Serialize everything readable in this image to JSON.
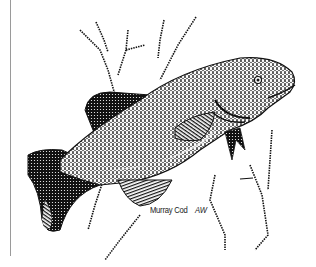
{
  "illustration": {
    "subject": "Murray Cod",
    "style": "pen-and-ink stipple drawing",
    "caption": {
      "species": "Murray Cod",
      "initials": "AW"
    }
  },
  "colors": {
    "ink": "#111111",
    "paper": "#ffffff",
    "frame_line": "#9a9a9a"
  }
}
